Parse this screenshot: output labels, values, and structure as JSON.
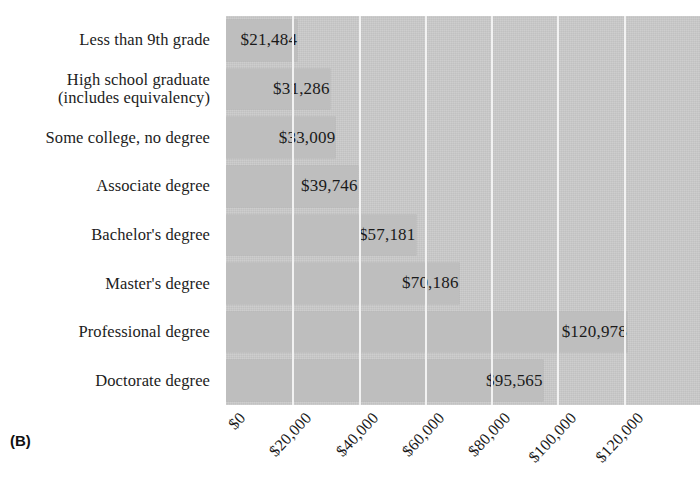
{
  "figure": {
    "panel_label": "(B)",
    "title_cutoff": "",
    "background_color": "#ffffff",
    "plot_background_color": "#c9c9c9",
    "bar_color": "#bebebe",
    "gridline_color": "#f2f2f2",
    "text_color": "#1a1a1a"
  },
  "chart_data": {
    "type": "bar",
    "orientation": "horizontal",
    "title": "",
    "xlabel": "",
    "ylabel": "",
    "categories": [
      "Less than 9th grade",
      "High school graduate (includes equivalency)",
      "Some college, no degree",
      "Associate degree",
      "Bachelor's degree",
      "Master's degree",
      "Professional degree",
      "Doctorate degree"
    ],
    "values": [
      21484,
      31286,
      33009,
      39746,
      57181,
      70186,
      120978,
      95565
    ],
    "value_labels": [
      "$21,484",
      "$31,286",
      "$33,009",
      "$39,746",
      "$57,181",
      "$70,186",
      "$120,978",
      "$95,565"
    ],
    "xlim": [
      0,
      143000
    ],
    "xticks": [
      0,
      20000,
      40000,
      60000,
      80000,
      100000,
      120000
    ],
    "xtick_labels": [
      "$0",
      "$20,000",
      "$40,000",
      "$60,000",
      "$80,000",
      "$100,000",
      "$120,000"
    ],
    "grid": "vertical",
    "legend": "none"
  },
  "y_axis": {
    "labels": [
      {
        "lines": [
          "Less than 9th grade"
        ]
      },
      {
        "lines": [
          "High school graduate",
          "(includes equivalency)"
        ]
      },
      {
        "lines": [
          "Some college, no degree"
        ]
      },
      {
        "lines": [
          "Associate degree"
        ]
      },
      {
        "lines": [
          "Bachelor's degree"
        ]
      },
      {
        "lines": [
          "Master's degree"
        ]
      },
      {
        "lines": [
          "Professional degree"
        ]
      },
      {
        "lines": [
          "Doctorate degree"
        ]
      }
    ]
  }
}
